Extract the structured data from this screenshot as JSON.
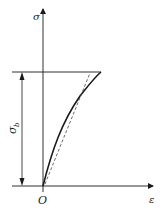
{
  "diagram": {
    "type": "stress-strain-curve",
    "axes": {
      "y_label": "σ",
      "x_label": "ε",
      "origin_label": "O"
    },
    "dimension": {
      "label_main": "σ",
      "label_sub": "b"
    },
    "curves": [
      {
        "name": "stress-strain-curve",
        "style": "solid"
      },
      {
        "name": "secant-line",
        "style": "dashed"
      }
    ],
    "colors": {
      "line": "#1a1a1a",
      "dashed": "#444444",
      "background": "#ffffff"
    }
  }
}
